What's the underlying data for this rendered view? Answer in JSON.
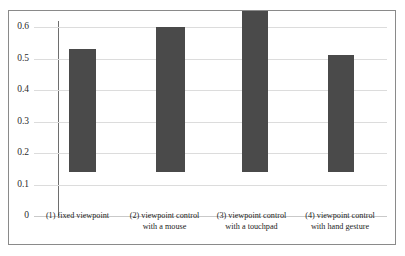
{
  "chart_data": {
    "type": "bar",
    "title": "",
    "subtitle": "",
    "xlabel": "",
    "ylabel": "",
    "categories": [
      "(1) fixed viewpoint",
      "(2) viewpoint control with a mouse",
      "(3) viewpoint control with a touchpad",
      "(4) viewpoint control with hand gesture"
    ],
    "category_lines": [
      [
        "(1) fixed viewpoint",
        ""
      ],
      [
        "(2) viewpoint control",
        "with a mouse"
      ],
      [
        "(3) viewpoint control",
        "with a touchpad"
      ],
      [
        "(4) viewpoint control",
        "with hand gesture"
      ]
    ],
    "values": [
      0.39,
      0.46,
      0.51,
      0.37
    ],
    "ylim": [
      0,
      0.6
    ],
    "yticks": [
      0,
      0.1,
      0.2,
      0.3,
      0.4,
      0.5,
      0.6
    ],
    "ytick_labels": [
      "0",
      "0.1",
      "0.2",
      "0.3",
      "0.4",
      "0.5",
      "0.6"
    ],
    "grid": true,
    "legend": false,
    "legend_position": "none",
    "series": [
      {
        "name": "",
        "values": [
          0.39,
          0.46,
          0.51,
          0.37
        ]
      }
    ],
    "colors": {
      "bar": "#4a4a4a",
      "gridline": "#dcdcdc",
      "axis": "#6e6e6e",
      "frame": "#8a8a8a",
      "background": "#ffffff",
      "text": "#242424"
    }
  }
}
